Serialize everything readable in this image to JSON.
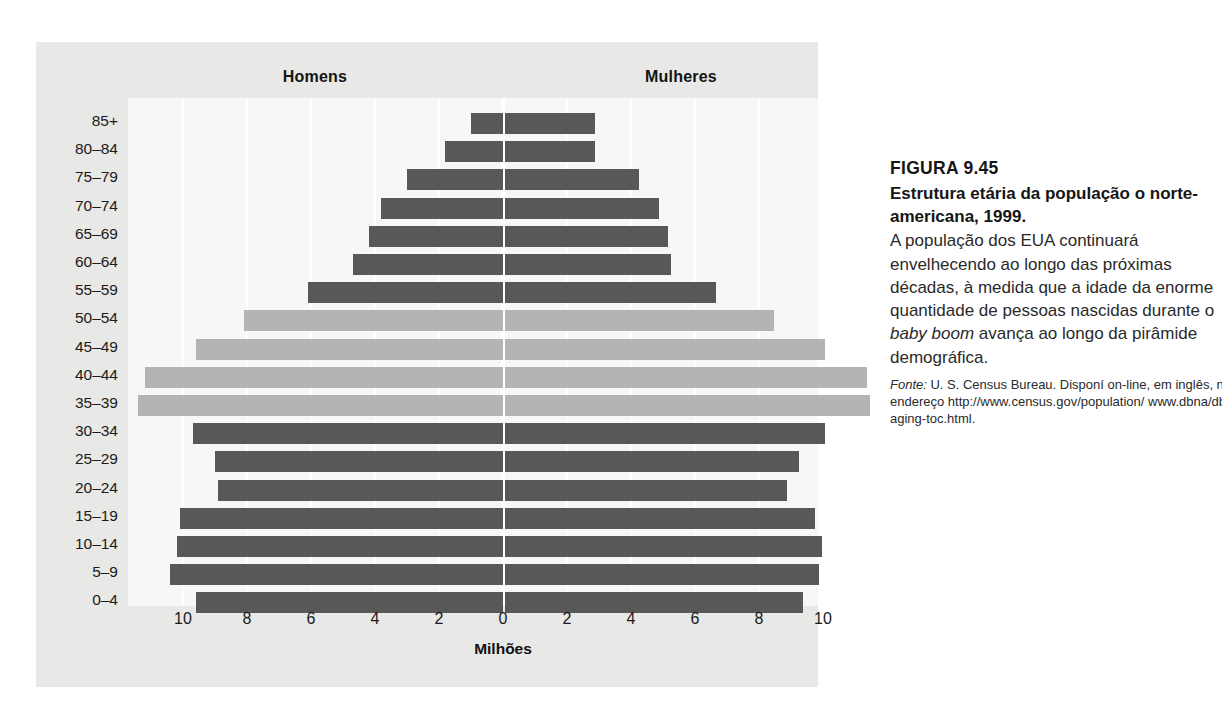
{
  "figure": {
    "column_headers": {
      "left": "Homens",
      "right": "Mulheres"
    },
    "x_axis_title": "Milhões",
    "x_ticks": [
      "12",
      "10",
      "8",
      "6",
      "4",
      "2",
      "0",
      "2",
      "4",
      "6",
      "8",
      "10",
      "12"
    ],
    "colors": {
      "bar_dark": "#585858",
      "bar_light": "#b4b4b4",
      "panel_background": "#e8e8e6",
      "plot_background": "#f7f7f6",
      "gridline": "#ffffff"
    }
  },
  "caption": {
    "figure_number": "FIGURA 9.45",
    "title": "Estrutura etária da população o norte-americana, 1999.",
    "body_before_italic": "A população dos EUA continuará envelhecendo ao longo das próximas décadas, à medida que a idade da enorme quantidade de pessoas nascidas durante o ",
    "body_italic": "baby boom",
    "body_after_italic": " avança ao longo da pirâmide demográfica.",
    "source_lead": "Fonte:",
    "source_text": " U. S. Census Bureau. Disponí on-line, em inglês, no endereço http://www.census.gov/population/ www.dbna/db-aging-toc.html."
  },
  "chart_data": {
    "type": "bar",
    "subtype": "population-pyramid",
    "xlabel": "Milhões",
    "ylabel": "",
    "xlim": [
      -12,
      12
    ],
    "grid": true,
    "legend_position": "top",
    "x_tick_values": [
      12,
      10,
      8,
      6,
      4,
      2,
      0,
      2,
      4,
      6,
      8,
      10,
      12
    ],
    "categories": [
      "85+",
      "80–84",
      "75–79",
      "70–74",
      "65–69",
      "60–64",
      "55–59",
      "50–54",
      "45–49",
      "40–44",
      "35–39",
      "30–34",
      "25–29",
      "20–24",
      "15–19",
      "10–14",
      "5–9",
      "0–4"
    ],
    "series": [
      {
        "name": "Homens",
        "side": "left",
        "values": [
          1.0,
          1.8,
          3.0,
          3.8,
          4.2,
          4.7,
          6.1,
          8.1,
          9.6,
          11.2,
          11.4,
          9.7,
          9.0,
          8.9,
          10.1,
          10.2,
          10.4,
          9.6
        ]
      },
      {
        "name": "Mulheres",
        "side": "right",
        "values": [
          2.8,
          2.8,
          4.2,
          4.8,
          5.1,
          5.2,
          6.6,
          8.4,
          10.0,
          11.3,
          11.4,
          10.0,
          9.2,
          8.8,
          9.7,
          9.9,
          9.8,
          9.3
        ]
      }
    ],
    "highlight_tone": {
      "note": "baby boom cohorts drawn in light gray",
      "light_categories": [
        "50–54",
        "45–49",
        "40–44",
        "35–39"
      ]
    }
  }
}
